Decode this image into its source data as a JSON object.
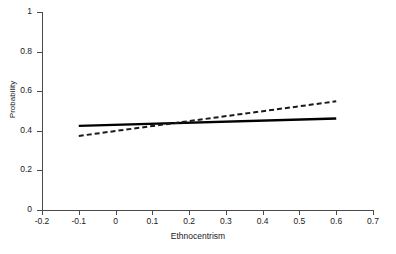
{
  "chart_data": {
    "type": "line",
    "title": "",
    "xlabel": "Ethnocentrism",
    "ylabel": "Probability",
    "xlim": [
      -0.2,
      0.7
    ],
    "ylim": [
      0,
      1
    ],
    "xticks": [
      "-0.2",
      "-0.1",
      "0",
      "0.1",
      "0.2",
      "0.3",
      "0.4",
      "0.5",
      "0.6",
      "0.7"
    ],
    "xtick_values": [
      -0.2,
      -0.1,
      0,
      0.1,
      0.2,
      0.3,
      0.4,
      0.5,
      0.6,
      0.7
    ],
    "yticks": [
      "0",
      "0.2",
      "0.4",
      "0.6",
      "0.8",
      "1"
    ],
    "ytick_values": [
      0,
      0.2,
      0.4,
      0.6,
      0.8,
      1
    ],
    "grid": false,
    "legend": "none",
    "series": [
      {
        "name": "solid-line",
        "style": "solid",
        "color": "#000000",
        "width": 2.4,
        "x": [
          -0.1,
          0.6
        ],
        "values": [
          0.425,
          0.462
        ]
      },
      {
        "name": "dashed-line",
        "style": "dashed",
        "color": "#1a1a1a",
        "width": 2.0,
        "x": [
          -0.1,
          0.6
        ],
        "values": [
          0.374,
          0.549
        ]
      }
    ],
    "annotations": []
  },
  "axes": {
    "y_title": "Probability",
    "x_title": "Ethnocentrism"
  },
  "caption": {
    "text": ""
  }
}
